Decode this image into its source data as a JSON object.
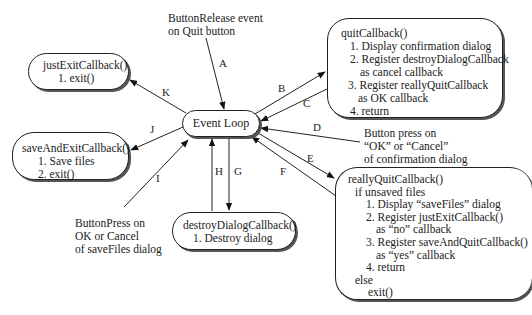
{
  "diagram": {
    "event_loop": "Event Loop",
    "nodes": {
      "just_exit": {
        "title": "justExitCallback()",
        "lines": [
          "1. exit()"
        ]
      },
      "save_and_exit": {
        "title": "saveAndExitCallback()",
        "lines": [
          "1. Save files",
          "2. exit()"
        ]
      },
      "destroy_dialog": {
        "title": "destroyDialogCallback()",
        "lines": [
          "1. Destroy dialog"
        ]
      },
      "quit": {
        "title": "quitCallback()",
        "lines": [
          "1. Display confirmation dialog",
          "2. Register destroyDialogCallback",
          "as cancel callback",
          "3. Register reallyQuitCallback",
          "as OK callback",
          "4. return"
        ]
      },
      "really_quit": {
        "title": "reallyQuitCallback()",
        "lines": [
          "if unsaved files",
          "1. Display “saveFiles” dialog",
          "2. Register justExitCallback()",
          "as “no” callback",
          "3. Register saveAndQuitCallback()",
          "as “yes” callback",
          "4. return",
          "else",
          "exit()"
        ]
      }
    },
    "annotations": {
      "quit_event": [
        "ButtonRelease event",
        "on Quit button"
      ],
      "confirm_event": [
        "Button press on",
        "“OK” or “Cancel”",
        "of confirmation dialog"
      ],
      "savefiles_event": [
        "ButtonPress on",
        "OK or Cancel",
        "of saveFiles dialog"
      ]
    },
    "edges": {
      "A": "A",
      "B": "B",
      "C": "C",
      "D": "D",
      "E": "E",
      "F": "F",
      "G": "G",
      "H": "H",
      "I": "I",
      "J": "J",
      "K": "K"
    }
  }
}
